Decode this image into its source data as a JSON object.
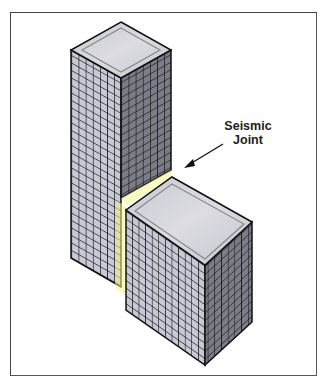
{
  "figure": {
    "label_line1": "Seismic",
    "label_line2": "Joint",
    "colors": {
      "frame": "#444444",
      "roof": "#d4d4d8",
      "roof_border": "#999999",
      "left_face": "#c8c8d6",
      "right_face": "#7c7c88",
      "grid_lines": "#1a1a1a",
      "joint_highlight": "#f0f07a"
    },
    "tall_tower": {
      "columns_left": 7,
      "columns_right": 7,
      "rows": 28
    },
    "short_building": {
      "columns_left": 12,
      "columns_right": 7,
      "rows": 13
    }
  }
}
